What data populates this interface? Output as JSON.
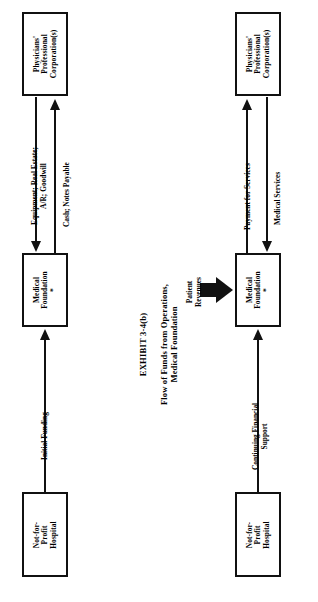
{
  "exhibit": {
    "number": "EXHIBIT 3-4(b)",
    "title_line1": "Flow of Funds from Operations,",
    "title_line2": "Medical Foundation"
  },
  "colors": {
    "ink": "#111111",
    "background": "#ffffff"
  },
  "panels": [
    {
      "id": "formation",
      "nodes": [
        {
          "id": "ppc-left",
          "line1": "Physicians'",
          "line2": "Professional",
          "line3": "Corporation(s)"
        },
        {
          "id": "foundation-left",
          "line1": "Medical",
          "line2": "Foundation *",
          "line3": ""
        },
        {
          "id": "hospital-left",
          "line1": "Not-for-Profit",
          "line2": "Hospital",
          "line3": ""
        }
      ],
      "flows": [
        {
          "id": "assets-transfer",
          "line1": "Equipment; Real Estate;",
          "line2": "A/R; Goodwill",
          "direction": "ppc-to-foundation"
        },
        {
          "id": "consideration",
          "line1": "Cash; Notes Payable",
          "line2": "",
          "direction": "foundation-to-ppc"
        },
        {
          "id": "initial-funding",
          "line1": "Initial Funding",
          "line2": "",
          "direction": "hospital-to-foundation"
        }
      ]
    },
    {
      "id": "operations",
      "nodes": [
        {
          "id": "ppc-right",
          "line1": "Physicians'",
          "line2": "Professional",
          "line3": "Corporation(s)"
        },
        {
          "id": "foundation-right",
          "line1": "Medical",
          "line2": "Foundation *",
          "line3": ""
        },
        {
          "id": "hospital-right",
          "line1": "Not-for-Profit",
          "line2": "Hospital",
          "line3": ""
        }
      ],
      "flows": [
        {
          "id": "payment-for-services",
          "line1": "Payment for Services",
          "line2": "",
          "direction": "foundation-to-ppc"
        },
        {
          "id": "medical-services",
          "line1": "Medical Services",
          "line2": "",
          "direction": "ppc-to-foundation"
        },
        {
          "id": "continuing-support",
          "line1": "Continuing Financial",
          "line2": "Support",
          "direction": "hospital-to-foundation"
        },
        {
          "id": "patient-revenues",
          "line1": "Patient",
          "line2": "Revenues",
          "direction": "into-foundation"
        }
      ]
    }
  ]
}
